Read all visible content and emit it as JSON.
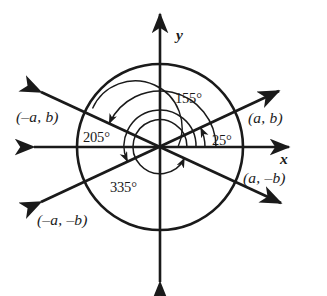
{
  "figure": {
    "kind": "coordinate-plane-angle-diagram",
    "background_color": "#ffffff",
    "stroke_color": "#1a1a1a",
    "center": {
      "x": 160,
      "y": 147
    }
  },
  "axes": {
    "x_label": "x",
    "y_label": "y",
    "x_start": {
      "x": 28,
      "y": 147
    },
    "x_end": {
      "x": 295,
      "y": 147
    },
    "y_start": {
      "x": 160,
      "y": 288
    },
    "y_end": {
      "x": 160,
      "y": 8
    },
    "arrowheads": "both-ends"
  },
  "circles": {
    "outer_radius": 83,
    "arc_radii": [
      18,
      27,
      36,
      45,
      56
    ]
  },
  "lines": [
    {
      "name": "line-25-205",
      "angle_deg": 25,
      "endpoints_labels": [
        "(a, b)",
        "(-a, -b)"
      ]
    },
    {
      "name": "line-155-335",
      "angle_deg": 155,
      "endpoints_labels": [
        "(-a, b)",
        "(a, -b)"
      ]
    }
  ],
  "angle_arcs": [
    {
      "name": "arc-25",
      "label": "25°",
      "degrees": 25,
      "radius": 45,
      "direction": "counterclockwise"
    },
    {
      "name": "arc-155",
      "label": "155°",
      "degrees": 155,
      "radius": 56,
      "direction": "counterclockwise"
    },
    {
      "name": "arc-205",
      "label": "205°",
      "degrees": 205,
      "radius": 36,
      "direction": "counterclockwise"
    },
    {
      "name": "arc-335",
      "label": "335°",
      "degrees": 335,
      "radius": 27,
      "direction": "counterclockwise"
    }
  ],
  "labels": {
    "angle_155": "155°",
    "angle_25": "25°",
    "angle_205": "205°",
    "angle_335": "335°",
    "point_upper_left": "(–a, b)",
    "point_upper_right": "(a, b)",
    "point_lower_right": "(a, –b)",
    "point_lower_left": "(–a, –b)",
    "axis_x": "x",
    "axis_y": "y"
  }
}
